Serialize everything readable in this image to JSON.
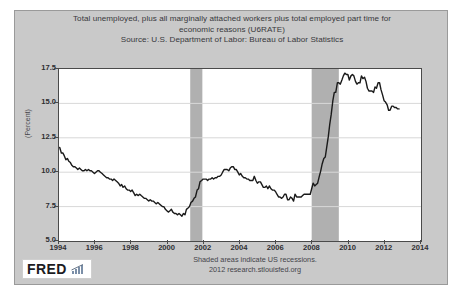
{
  "chart": {
    "title_line1": "Total unemployed, plus all marginally attached workers plus total employed part time for",
    "title_line2": "economic reasons (U6RATE)",
    "source": "Source: U.S. Department of Labor: Bureau of Labor Statistics",
    "ylabel": "(Percent)",
    "footer_line1": "Shaded areas indicate US recessions.",
    "footer_line2": "2012 research.stlouisfed.org",
    "logo_text": "FRED",
    "logo_icon": "bar-chart-icon"
  },
  "chart_data": {
    "type": "line",
    "title": "Total unemployed, plus all marginally attached workers plus total employed part time for economic reasons (U6RATE)",
    "subtitle": "Source: U.S. Department of Labor: Bureau of Labor Statistics",
    "xlabel": "",
    "ylabel": "(Percent)",
    "xlim": [
      1994.0,
      2014.0
    ],
    "ylim": [
      5.0,
      17.5
    ],
    "xticks": [
      1994,
      1996,
      1998,
      2000,
      2002,
      2004,
      2006,
      2008,
      2010,
      2012,
      2014
    ],
    "yticks": [
      5.0,
      7.5,
      10.0,
      12.5,
      15.0,
      17.5
    ],
    "grid": true,
    "legend": "none",
    "line_color": "#1a1a1a",
    "plot_bg": "#ffffff",
    "panel_bg": "#c9c9c9",
    "recession_color": "#b0b0b0",
    "series": [
      {
        "name": "U6RATE",
        "x": [
          1994.04,
          1994.13,
          1994.21,
          1994.29,
          1994.38,
          1994.46,
          1994.54,
          1994.63,
          1994.71,
          1994.79,
          1994.88,
          1994.96,
          1995.04,
          1995.13,
          1995.21,
          1995.29,
          1995.38,
          1995.46,
          1995.54,
          1995.63,
          1995.71,
          1995.79,
          1995.88,
          1995.96,
          1996.04,
          1996.13,
          1996.21,
          1996.29,
          1996.38,
          1996.46,
          1996.54,
          1996.63,
          1996.71,
          1996.79,
          1996.88,
          1996.96,
          1997.04,
          1997.13,
          1997.21,
          1997.29,
          1997.38,
          1997.46,
          1997.54,
          1997.63,
          1997.71,
          1997.79,
          1997.88,
          1997.96,
          1998.04,
          1998.13,
          1998.21,
          1998.29,
          1998.38,
          1998.46,
          1998.54,
          1998.63,
          1998.71,
          1998.79,
          1998.88,
          1998.96,
          1999.04,
          1999.13,
          1999.21,
          1999.29,
          1999.38,
          1999.46,
          1999.54,
          1999.63,
          1999.71,
          1999.79,
          1999.88,
          1999.96,
          2000.04,
          2000.13,
          2000.21,
          2000.29,
          2000.38,
          2000.46,
          2000.54,
          2000.63,
          2000.71,
          2000.79,
          2000.88,
          2000.96,
          2001.04,
          2001.13,
          2001.21,
          2001.29,
          2001.38,
          2001.46,
          2001.54,
          2001.63,
          2001.71,
          2001.79,
          2001.88,
          2001.96,
          2002.04,
          2002.13,
          2002.21,
          2002.29,
          2002.38,
          2002.46,
          2002.54,
          2002.63,
          2002.71,
          2002.79,
          2002.88,
          2002.96,
          2003.04,
          2003.13,
          2003.21,
          2003.29,
          2003.38,
          2003.46,
          2003.54,
          2003.63,
          2003.71,
          2003.79,
          2003.88,
          2003.96,
          2004.04,
          2004.13,
          2004.21,
          2004.29,
          2004.38,
          2004.46,
          2004.54,
          2004.63,
          2004.71,
          2004.79,
          2004.88,
          2004.96,
          2005.04,
          2005.13,
          2005.21,
          2005.29,
          2005.38,
          2005.46,
          2005.54,
          2005.63,
          2005.71,
          2005.79,
          2005.88,
          2005.96,
          2006.04,
          2006.13,
          2006.21,
          2006.29,
          2006.38,
          2006.46,
          2006.54,
          2006.63,
          2006.71,
          2006.79,
          2006.88,
          2006.96,
          2007.04,
          2007.13,
          2007.21,
          2007.29,
          2007.38,
          2007.46,
          2007.54,
          2007.63,
          2007.71,
          2007.79,
          2007.88,
          2007.96,
          2008.04,
          2008.13,
          2008.21,
          2008.29,
          2008.38,
          2008.46,
          2008.54,
          2008.63,
          2008.71,
          2008.79,
          2008.88,
          2008.96,
          2009.04,
          2009.13,
          2009.21,
          2009.29,
          2009.38,
          2009.46,
          2009.54,
          2009.63,
          2009.71,
          2009.79,
          2009.88,
          2009.96,
          2010.04,
          2010.13,
          2010.21,
          2010.29,
          2010.38,
          2010.46,
          2010.54,
          2010.63,
          2010.71,
          2010.79,
          2010.88,
          2010.96,
          2011.04,
          2011.13,
          2011.21,
          2011.29,
          2011.38,
          2011.46,
          2011.54,
          2011.63,
          2011.71,
          2011.79,
          2011.88,
          2011.96,
          2012.04,
          2012.13,
          2012.21,
          2012.29,
          2012.38,
          2012.46,
          2012.54,
          2012.63,
          2012.71,
          2012.79
        ],
        "y": [
          11.8,
          11.4,
          11.4,
          11.2,
          10.9,
          11.0,
          10.8,
          10.7,
          10.5,
          10.4,
          10.4,
          10.3,
          10.2,
          10.3,
          10.2,
          10.1,
          10.1,
          10.2,
          10.1,
          10.2,
          10.1,
          10.1,
          10.0,
          9.9,
          10.0,
          10.1,
          10.1,
          10.0,
          9.9,
          9.8,
          9.7,
          9.6,
          9.6,
          9.5,
          9.5,
          9.4,
          9.5,
          9.4,
          9.3,
          9.2,
          9.0,
          9.1,
          8.9,
          9.0,
          8.8,
          8.7,
          8.7,
          8.6,
          8.7,
          8.5,
          8.3,
          8.4,
          8.3,
          8.4,
          8.3,
          8.2,
          8.1,
          8.1,
          8.0,
          7.9,
          8.0,
          7.9,
          7.9,
          7.8,
          7.7,
          7.8,
          7.7,
          7.6,
          7.5,
          7.5,
          7.3,
          7.2,
          7.1,
          7.2,
          7.3,
          7.1,
          7.0,
          7.0,
          6.9,
          7.0,
          6.9,
          6.8,
          7.0,
          6.9,
          7.3,
          7.4,
          7.5,
          7.8,
          7.9,
          8.1,
          8.2,
          8.7,
          8.8,
          9.3,
          9.4,
          9.5,
          9.5,
          9.5,
          9.4,
          9.5,
          9.5,
          9.6,
          9.5,
          9.6,
          9.6,
          9.7,
          9.7,
          9.8,
          10.0,
          10.2,
          10.2,
          10.2,
          10.1,
          10.3,
          10.4,
          10.4,
          10.2,
          10.2,
          10.0,
          9.8,
          9.9,
          9.7,
          9.6,
          9.6,
          9.5,
          9.5,
          9.4,
          9.4,
          9.4,
          9.7,
          9.4,
          9.2,
          9.3,
          9.3,
          9.1,
          8.9,
          8.9,
          9.0,
          8.8,
          9.0,
          8.8,
          8.7,
          8.7,
          8.6,
          8.4,
          8.2,
          8.2,
          8.1,
          8.2,
          8.4,
          8.4,
          8.0,
          8.0,
          8.2,
          8.1,
          7.9,
          8.4,
          8.2,
          8.2,
          8.2,
          8.2,
          8.3,
          8.4,
          8.4,
          8.4,
          8.4,
          8.4,
          8.8,
          9.2,
          9.0,
          9.1,
          9.2,
          9.7,
          10.1,
          10.6,
          11.0,
          11.1,
          11.8,
          12.6,
          13.5,
          14.2,
          15.2,
          15.8,
          15.8,
          16.5,
          16.5,
          16.4,
          16.7,
          17.0,
          17.2,
          17.1,
          17.1,
          16.7,
          17.0,
          17.1,
          17.0,
          16.6,
          16.4,
          16.5,
          16.5,
          17.0,
          16.8,
          16.9,
          16.6,
          16.1,
          15.9,
          15.9,
          15.9,
          15.8,
          16.2,
          16.1,
          16.5,
          16.5,
          16.0,
          15.6,
          15.2,
          15.1,
          14.9,
          14.5,
          14.5,
          14.8,
          14.8,
          14.7,
          14.7,
          14.6,
          14.6
        ]
      }
    ],
    "recessions": [
      {
        "label": "2001 recession",
        "start": 2001.25,
        "end": 2001.92
      },
      {
        "label": "2008-2009 recession",
        "start": 2007.96,
        "end": 2009.46
      }
    ],
    "annotations": [
      "Shaded areas indicate US recessions.",
      "2012 research.stlouisfed.org"
    ]
  }
}
